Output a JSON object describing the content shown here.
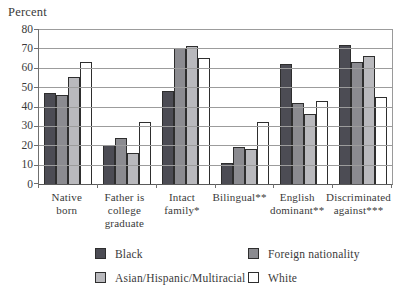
{
  "chart_data": {
    "type": "bar",
    "title": "",
    "xlabel": "",
    "ylabel": "Percent",
    "ylim": [
      0,
      80
    ],
    "ytick_step": 10,
    "grid": true,
    "legend_position": "bottom",
    "categories": [
      "Native\nborn",
      "Father is\ncollege\ngraduate",
      "Intact\nfamily*",
      "Bilingual**",
      "English\ndominant**",
      "Discriminated\nagainst***"
    ],
    "series": [
      {
        "name": "Black",
        "color": "#4c4c54",
        "values": [
          47,
          20,
          48,
          11,
          62,
          72
        ]
      },
      {
        "name": "Foreign nationality",
        "color": "#8b8b90",
        "values": [
          46,
          24,
          70,
          19,
          42,
          63
        ]
      },
      {
        "name": "Asian/Hispanic/Multiracial",
        "color": "#b9b9bd",
        "values": [
          55,
          16,
          71,
          18,
          36,
          66
        ]
      },
      {
        "name": "White",
        "color": "#ffffff",
        "values": [
          63,
          32,
          65,
          32,
          43,
          45
        ]
      }
    ]
  }
}
